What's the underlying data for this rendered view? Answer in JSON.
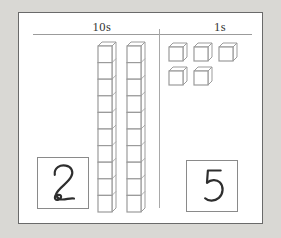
{
  "page": {
    "background_color": "#d9d8d4"
  },
  "card": {
    "background_color": "#ffffff",
    "border_color": "#6a6a6a"
  },
  "columns": {
    "tens_label": "10s",
    "ones_label": "1s"
  },
  "blocks": {
    "tens_rod_count": 2,
    "cubes_per_rod": 10,
    "ones_unit_count": 5,
    "ones_rows": [
      3,
      2
    ],
    "line_color": "#9b9b9b",
    "face_color": "#ffffff"
  },
  "answers": {
    "tens_digit": "2",
    "ones_digit": "5",
    "digit_color": "#2e2e2e"
  }
}
